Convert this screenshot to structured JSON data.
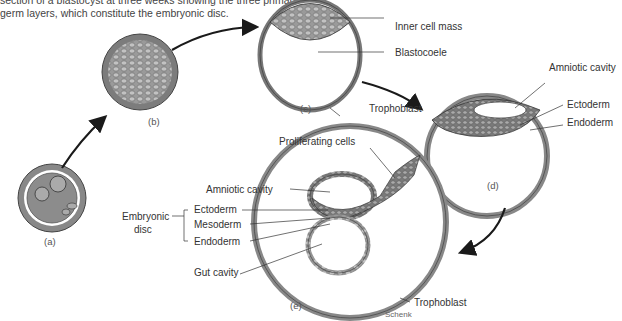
{
  "caption": {
    "line1": "section of a blastocyst at three weeks showing the three primary",
    "line2": "germ layers, which constitute the embryonic disc."
  },
  "stages": {
    "a": "(a)",
    "b": "(b)",
    "c": "(c)",
    "d": "(d)",
    "e": "(e)"
  },
  "labels_c": {
    "inner_cell_mass": "Inner cell mass",
    "blastocoele": "Blastocoele",
    "trophoblast": "Trophoblast"
  },
  "labels_d": {
    "amniotic_cavity": "Amniotic cavity",
    "ectoderm": "Ectoderm",
    "endoderm": "Endoderm"
  },
  "labels_e": {
    "proliferating_cells": "Proliferating cells",
    "amniotic_cavity": "Amniotic cavity",
    "embryonic_disc_1": "Embryonic",
    "embryonic_disc_2": "disc",
    "ectoderm": "Ectoderm",
    "mesoderm": "Mesoderm",
    "endoderm": "Endoderm",
    "gut_cavity": "Gut cavity",
    "trophoblast": "Trophoblast"
  },
  "signature": "Schenk",
  "colors": {
    "cell_fill": "#8a8a8a",
    "cell_light": "#b8b8b8",
    "outline": "#333333",
    "arrow": "#1a1a1a"
  }
}
